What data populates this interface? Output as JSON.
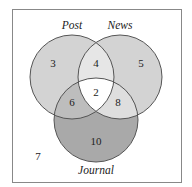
{
  "diagram": {
    "type": "venn-3",
    "sets": [
      {
        "name": "Post",
        "label": "Post"
      },
      {
        "name": "News",
        "label": "News"
      },
      {
        "name": "Journal",
        "label": "Journal"
      }
    ],
    "regions": {
      "post_only": "3",
      "news_only": "5",
      "journal_only": "10",
      "post_news": "4",
      "post_journal": "6",
      "news_journal": "8",
      "all_three": "2",
      "none": "7"
    },
    "colors": {
      "single_post_news": "#d3d3d3",
      "journal_only": "#a9a9a9",
      "post_news_overlap": "#e6e6e6",
      "post_journal_overlap": "#bdbdbd",
      "news_journal_overlap": "#dedede",
      "center": "#ffffff",
      "stroke": "#555555",
      "frame": "#888888"
    }
  }
}
